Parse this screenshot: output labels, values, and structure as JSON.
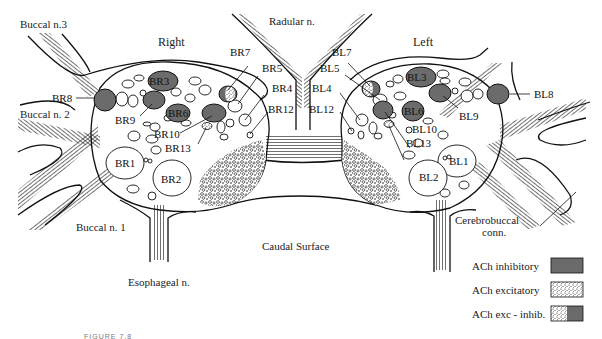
{
  "diagram": {
    "title_right": "Right",
    "title_left": "Left",
    "nerves": {
      "buccal3": "Buccal n.3",
      "buccal2": "Buccal n. 2",
      "buccal1": "Buccal n. 1",
      "radular": "Radular n.",
      "esophageal": "Esophageal n.",
      "cerebrobuccal_1": "Cerebrobuccal",
      "cerebrobuccal_2": "conn.",
      "caudal": "Caudal Surface"
    },
    "right_ganglion": {
      "BR1": "BR1",
      "BR2": "BR2",
      "BR3": "BR3",
      "BR4": "BR4",
      "BR5": "BR5",
      "BR6": "BR6",
      "BR7": "BR7",
      "BR8": "BR8",
      "BR9": "BR9",
      "BR10": "BR10",
      "BR12": "BR12",
      "BR13": "BR13"
    },
    "left_ganglion": {
      "BL1": "BL1",
      "BL2": "BL2",
      "BL3": "BL3",
      "BL4": "BL4",
      "BL5": "BL5",
      "BL6": "BL6",
      "BL7": "BL7",
      "BL8": "BL8",
      "BL9": "BL9",
      "BL10": "BL10",
      "BL12": "BL12",
      "BL13": "BL13"
    },
    "legend": [
      {
        "label": "ACh inhibitory",
        "pattern": "solid-gray"
      },
      {
        "label": "ACh excitatory",
        "pattern": "stipple"
      },
      {
        "label": "ACh exc - inhib.",
        "pattern": "half-stipple-half-gray"
      }
    ],
    "caption": "FIGURE 7.8",
    "colors": {
      "inhibitory": "#6b6b6b",
      "line": "#111111",
      "background": "#ffffff"
    }
  }
}
